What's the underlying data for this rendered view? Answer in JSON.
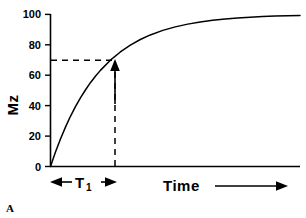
{
  "panel": {
    "label": "A"
  },
  "chart_data": {
    "type": "line",
    "title": "",
    "subtitle": "",
    "xlabel": "Time",
    "ylabel": "Mz",
    "grid": false,
    "legend": null,
    "xlim": [
      0,
      5
    ],
    "ylim": [
      0,
      100
    ],
    "x_ticks": [],
    "x_tick_labels": [],
    "y_ticks": [
      0,
      20,
      40,
      60,
      80,
      100
    ],
    "y_tick_labels": [
      "0",
      "20",
      "40",
      "60",
      "80",
      "100"
    ],
    "series": [
      {
        "name": "Longitudinal magnetization recovery",
        "equation": "Mz = 100 * (1 - exp(-t / T1))",
        "x": [
          0.0,
          0.1,
          0.2,
          0.3,
          0.4,
          0.5,
          0.6,
          0.7,
          0.8,
          0.9,
          1.0,
          1.2,
          1.4,
          1.6,
          1.8,
          2.0,
          2.25,
          2.5,
          2.75,
          3.0,
          3.25,
          3.5,
          3.75,
          4.0,
          4.25,
          4.5,
          4.75,
          5.0
        ],
        "y": [
          0.0,
          9.5,
          18.1,
          25.9,
          33.0,
          39.3,
          45.1,
          50.3,
          55.1,
          59.3,
          63.2,
          69.9,
          75.3,
          79.8,
          83.5,
          86.5,
          89.5,
          91.8,
          93.6,
          95.0,
          96.1,
          97.0,
          97.6,
          98.2,
          98.6,
          98.9,
          99.1,
          99.3
        ]
      }
    ],
    "annotations": [
      {
        "name": "t1-horizontal-dashed-line",
        "type": "dashed_hline",
        "y_value": 67,
        "x_from": 0,
        "x_to": 1.0
      },
      {
        "name": "t1-vertical-dashed-line",
        "type": "dashed_vline",
        "x_value": 1.0,
        "y_from": 0,
        "y_to": 67
      },
      {
        "name": "t1-up-arrow",
        "type": "arrow_up",
        "x_value": 1.0,
        "y_from": 41,
        "y_to": 67
      },
      {
        "name": "t1-span-arrow",
        "type": "double_arrow",
        "label": "T",
        "subscript": "1",
        "x_from": 0,
        "x_to": 1.0
      },
      {
        "name": "time-axis-arrow",
        "type": "arrow_right",
        "label": "Time"
      }
    ]
  },
  "labels": {
    "y_axis_title": "Mz",
    "x_axis_title": "Time",
    "t1_symbol": "T",
    "t1_subscript": "1"
  }
}
